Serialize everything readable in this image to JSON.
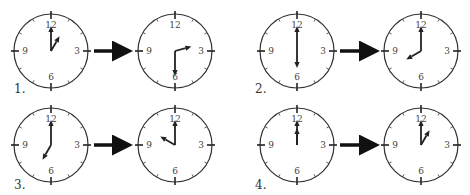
{
  "figure": {
    "numerals": [
      "12",
      "3",
      "6",
      "9"
    ],
    "clock_radius": 37,
    "colors": {
      "ink": "#222222",
      "face": "#ffffff",
      "numeral": "#444444"
    },
    "problems": [
      {
        "label": "1.",
        "label_pos": [
          14,
          93
        ],
        "from": {
          "time": "1:00",
          "hour": 1,
          "minute": 0,
          "center": [
            51,
            51
          ]
        },
        "to": {
          "time": "2:30",
          "hour": 2.5,
          "minute": 30,
          "center": [
            175,
            51
          ]
        },
        "arrow": {
          "x1": 94,
          "x2": 127,
          "y": 51
        }
      },
      {
        "label": "2.",
        "label_pos": [
          255,
          93
        ],
        "from": {
          "time": "6:00",
          "hour": 6,
          "minute": 0,
          "center": [
            297,
            51
          ]
        },
        "to": {
          "time": "8:00",
          "hour": 8,
          "minute": 0,
          "center": [
            421,
            51
          ]
        },
        "arrow": {
          "x1": 340,
          "x2": 374,
          "y": 51
        }
      },
      {
        "label": "3.",
        "label_pos": [
          14,
          189
        ],
        "from": {
          "time": "7:00",
          "hour": 7,
          "minute": 0,
          "center": [
            51,
            145
          ]
        },
        "to": {
          "time": "10:00",
          "hour": 10,
          "minute": 0,
          "center": [
            175,
            145
          ]
        },
        "arrow": {
          "x1": 94,
          "x2": 127,
          "y": 145
        }
      },
      {
        "label": "4.",
        "label_pos": [
          255,
          189
        ],
        "from": {
          "time": "12:00",
          "hour": 12,
          "minute": 0,
          "center": [
            297,
            145
          ]
        },
        "to": {
          "time": "1:00",
          "hour": 1,
          "minute": 0,
          "center": [
            421,
            145
          ]
        },
        "arrow": {
          "x1": 340,
          "x2": 374,
          "y": 145
        }
      }
    ]
  }
}
